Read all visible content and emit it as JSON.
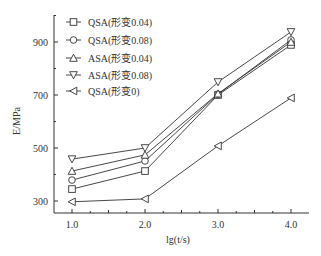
{
  "chart_data": {
    "type": "line",
    "title": "",
    "xlabel": "lg(t/s)",
    "ylabel": "E/MPa",
    "x": [
      1.0,
      2.0,
      3.0,
      4.0
    ],
    "xticks": [
      "1.0",
      "2.0",
      "3.0",
      "4.0"
    ],
    "yticks": [
      "300",
      "500",
      "700",
      "900"
    ],
    "ylim": [
      255,
      1000
    ],
    "xlim": [
      0.75,
      4.25
    ],
    "grid": false,
    "legend_position": "upper left",
    "series": [
      {
        "name": "QSA(形变0.04)",
        "marker": "square",
        "values": [
          345,
          413,
          700,
          889
        ]
      },
      {
        "name": "QSA(形变0.08)",
        "marker": "circle",
        "values": [
          379,
          451,
          703,
          908
        ]
      },
      {
        "name": "ASA(形变0.04)",
        "marker": "triangle-up",
        "values": [
          413,
          474,
          705,
          900
        ]
      },
      {
        "name": "ASA(形变0.08)",
        "marker": "triangle-down",
        "values": [
          458,
          500,
          749,
          938
        ]
      },
      {
        "name": "QSA(形变0)",
        "marker": "triangle-left",
        "values": [
          297,
          308,
          508,
          689
        ]
      }
    ]
  },
  "colors": {
    "line": "#333333",
    "axis": "#333333",
    "background": "#ffffff"
  }
}
